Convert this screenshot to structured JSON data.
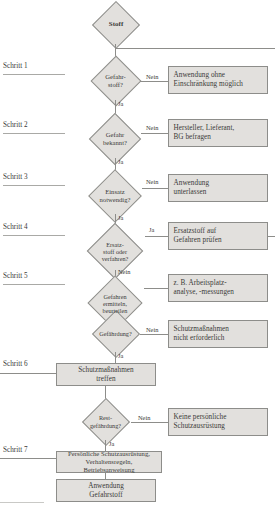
{
  "diagram": {
    "title": "Stoff",
    "language": "de",
    "colors": {
      "node_fill": "#e2e0dd",
      "node_border": "#8d8d8a",
      "line": "#8d8d8a",
      "text": "#3a3a38",
      "background": "#ffffff"
    }
  },
  "steps": [
    {
      "label": "Schritt 1"
    },
    {
      "label": "Schritt 2"
    },
    {
      "label": "Schritt 3"
    },
    {
      "label": "Schritt 4"
    },
    {
      "label": "Schritt 5"
    },
    {
      "label": "Schritt 6"
    },
    {
      "label": "Schritt 7"
    }
  ],
  "nodes": {
    "start": {
      "text": "Stoff"
    },
    "d1": {
      "line1": "Gefahr-",
      "line2": "stoff?"
    },
    "d2": {
      "line1": "Gefahr",
      "line2": "bekannt?"
    },
    "d3": {
      "line1": "Einsatz",
      "line2": "notwendig?"
    },
    "d4": {
      "line1": "Ersatz-",
      "line2": "stoff oder",
      "line3": "verfahren?"
    },
    "d5": {
      "line1": "Gefahren",
      "line2": "ermitteln,",
      "line3": "beurteilen"
    },
    "d6": {
      "line1": "Gefährdung?"
    },
    "d7": {
      "line1": "Rest-",
      "line2": "gefährdung?"
    },
    "r1": {
      "line1": "Anwendung ohne",
      "line2": "Einschränkung möglich"
    },
    "r2": {
      "line1": "Hersteller, Lieferant,",
      "line2": "BG befragen"
    },
    "r3": {
      "line1": "Anwendung",
      "line2": "unterlassen"
    },
    "r4": {
      "line1": "Ersatzstoff auf",
      "line2": "Gefahren prüfen"
    },
    "r5": {
      "line1": "z. B. Arbeitsplatz-",
      "line2": "analyse, -messungen"
    },
    "r6": {
      "line1": "Schutzmaßnahmen",
      "line2": "nicht erforderlich"
    },
    "r7": {
      "line1": "Keine persönliche",
      "line2": "Schutzausrüstung"
    },
    "b6": {
      "line1": "Schutzmaßnahmen",
      "line2": "treffen"
    },
    "b7": {
      "line1": "Persönliche Schutzausrüstung,",
      "line2": "Verhaltensregeln, Betriebsanweisung"
    },
    "b8": {
      "line1": "Anwendung",
      "line2": "Gefahrstoff"
    }
  },
  "edge_labels": {
    "nein1": "Nein",
    "ja1": "Ja",
    "nein2": "Nein",
    "ja2": "Ja",
    "nein3": "Nein",
    "ja3": "Ja",
    "ja4": "Ja",
    "nein4": "Nein",
    "nein6": "Nein",
    "ja6": "Ja",
    "nein7": "Nein",
    "ja7": "Ja"
  }
}
